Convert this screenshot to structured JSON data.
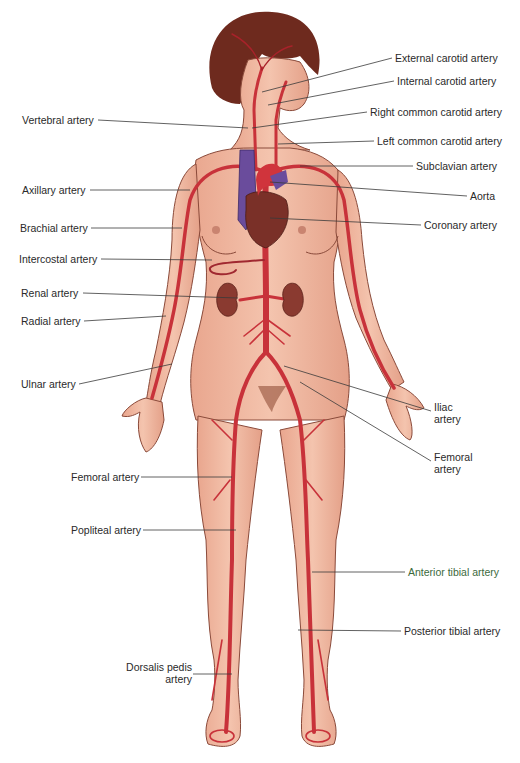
{
  "figure": {
    "colors": {
      "skin": "#f0b8a0",
      "skin_shadow": "#d9917a",
      "outline": "#8a4a3a",
      "artery": "#c8323a",
      "artery_dark": "#8e1c22",
      "heart_vein": "#6a4c9c",
      "heart_muscle": "#7a3028",
      "kidney": "#8a3a30",
      "hair": "#6e2a1e",
      "leader_line": "#3a3a3a",
      "label_text": "#2a2a2a"
    },
    "labels_left": [
      {
        "id": "vertebral",
        "text": "Vertebral artery",
        "x": 22,
        "y": 114,
        "target": [
          248,
          128
        ]
      },
      {
        "id": "axillary",
        "text": "Axillary artery",
        "x": 22,
        "y": 184,
        "target": [
          190,
          190
        ]
      },
      {
        "id": "brachial",
        "text": "Brachial artery",
        "x": 20,
        "y": 222,
        "target": [
          182,
          228
        ]
      },
      {
        "id": "intercostal",
        "text": "Intercostal artery",
        "x": 19,
        "y": 253,
        "target": [
          212,
          260
        ]
      },
      {
        "id": "renal",
        "text": "Renal artery",
        "x": 21,
        "y": 287,
        "target": [
          238,
          298
        ]
      },
      {
        "id": "radial",
        "text": "Radial artery",
        "x": 21,
        "y": 315,
        "target": [
          166,
          316
        ]
      },
      {
        "id": "ulnar",
        "text": "Ulnar artery",
        "x": 21,
        "y": 378,
        "target": [
          172,
          364
        ]
      },
      {
        "id": "femoral_left",
        "text": "Femoral artery",
        "x": 71,
        "y": 471,
        "target": [
          232,
          477
        ]
      },
      {
        "id": "popliteal",
        "text": "Popliteal artery",
        "x": 71,
        "y": 524,
        "target": [
          236,
          530
        ]
      },
      {
        "id": "dorsalis_pedis",
        "text": "Dorsalis pedis artery",
        "line1": "Dorsalis pedis",
        "line2": "artery",
        "x": 122,
        "y": 665,
        "target": [
          232,
          674
        ]
      }
    ],
    "labels_right": [
      {
        "id": "external_carotid",
        "text": "External carotid artery",
        "x": 395,
        "y": 52,
        "target": [
          262,
          92
        ]
      },
      {
        "id": "internal_carotid",
        "text": "Internal carotid artery",
        "x": 397,
        "y": 75,
        "target": [
          268,
          105
        ]
      },
      {
        "id": "right_common_carotid",
        "text": "Right common carotid artery",
        "x": 370,
        "y": 106,
        "target": [
          252,
          128
        ]
      },
      {
        "id": "left_common_carotid",
        "text": "Left common carotid artery",
        "x": 377,
        "y": 135,
        "target": [
          278,
          144
        ]
      },
      {
        "id": "subclavian",
        "text": "Subclavian artery",
        "x": 416,
        "y": 161,
        "target": [
          300,
          166
        ]
      },
      {
        "id": "aorta",
        "text": "Aorta",
        "x": 470,
        "y": 190,
        "target": [
          270,
          182
        ]
      },
      {
        "id": "coronary",
        "text": "Coronary artery",
        "x": 424,
        "y": 219,
        "target": [
          270,
          218
        ]
      },
      {
        "id": "iliac",
        "text": "Iliac artery",
        "line1": "Iliac",
        "line2": "artery",
        "x": 434,
        "y": 401,
        "target": [
          284,
          366
        ]
      },
      {
        "id": "femoral_right",
        "text": "Femoral artery",
        "line1": "Femoral",
        "line2": "artery",
        "x": 434,
        "y": 451,
        "target": [
          300,
          382
        ]
      },
      {
        "id": "anterior_tibial",
        "text": "Anterior tibial artery",
        "x": 408,
        "y": 566,
        "target": [
          312,
          572
        ]
      },
      {
        "id": "posterior_tibial",
        "text": "Posterior tibial artery",
        "x": 404,
        "y": 625,
        "target": [
          298,
          630
        ]
      }
    ]
  }
}
